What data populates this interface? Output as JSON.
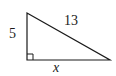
{
  "figure": {
    "type": "right-triangle",
    "labels": {
      "leg_vertical": "5",
      "hypotenuse": "13",
      "leg_horizontal": "x"
    },
    "right_angle_marker": true,
    "stroke_color": "#1a1a1a",
    "background": "#ffffff"
  }
}
